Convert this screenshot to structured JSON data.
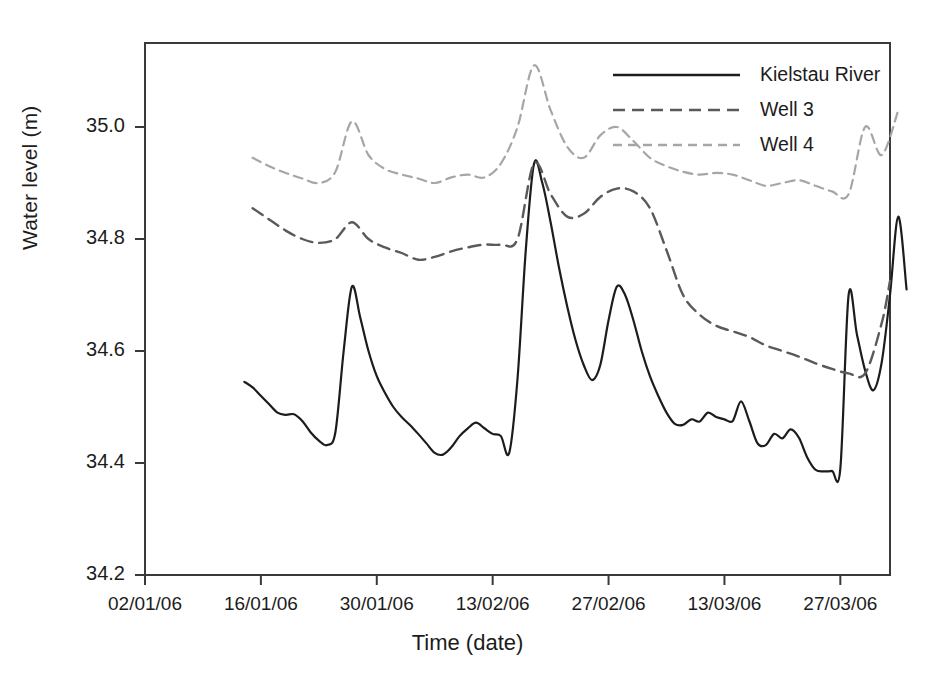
{
  "chart_data": {
    "type": "line",
    "title": "",
    "xlabel": "Time (date)",
    "ylabel": "Water level (m)",
    "ylim": [
      34.2,
      35.15
    ],
    "xlim": [
      "02/01/06",
      "31/03/06"
    ],
    "grid": false,
    "legend_position": "top-right",
    "yticks": [
      "34.2",
      "34.4",
      "34.6",
      "34.8",
      "35.0"
    ],
    "ytick_values": [
      34.2,
      34.4,
      34.6,
      34.8,
      35.0
    ],
    "xticks": [
      "02/01/06",
      "16/01/06",
      "30/01/06",
      "13/02/06",
      "27/02/06",
      "13/03/06",
      "27/03/06"
    ],
    "xtick_days": [
      0,
      14,
      28,
      42,
      56,
      70,
      84
    ],
    "series": [
      {
        "name": "Kielstau River",
        "color": "#1c1c1c",
        "dash": "none",
        "width": 2.2,
        "x": [
          12,
          13,
          14,
          15,
          16,
          17,
          18,
          19,
          20,
          21,
          22,
          23,
          24,
          25,
          26,
          27,
          28,
          29,
          30,
          31,
          32,
          33,
          34,
          35,
          36,
          37,
          38,
          39,
          40,
          41,
          42,
          43,
          44,
          45,
          46,
          47,
          48,
          49,
          50,
          51,
          52,
          53,
          54,
          55,
          56,
          57,
          58,
          59,
          60,
          61,
          62,
          63,
          64,
          65,
          66,
          67,
          68,
          69,
          70,
          71,
          72,
          73,
          74,
          75,
          76,
          77,
          78,
          79,
          80,
          81,
          82,
          83,
          84,
          85,
          86,
          87,
          88,
          89
        ],
        "values": [
          34.545,
          34.535,
          34.52,
          34.505,
          34.49,
          34.486,
          34.487,
          34.475,
          34.455,
          34.44,
          34.432,
          34.455,
          34.6,
          34.715,
          34.66,
          34.6,
          34.555,
          34.525,
          34.5,
          34.482,
          34.468,
          34.452,
          34.435,
          34.418,
          34.415,
          34.428,
          34.448,
          34.462,
          34.472,
          34.462,
          34.452,
          34.448,
          34.418,
          34.55,
          34.78,
          34.935,
          34.9,
          34.83,
          34.75,
          34.68,
          34.62,
          34.575,
          34.548,
          34.575,
          34.655,
          34.715,
          34.7,
          34.655,
          34.6,
          34.555,
          34.52,
          34.49,
          34.47,
          34.468,
          34.478,
          34.474,
          34.49,
          34.482,
          34.478,
          34.475,
          34.51,
          34.475,
          34.435,
          34.432,
          34.452,
          34.444,
          34.46,
          34.445,
          34.41,
          34.388,
          34.385,
          34.386,
          34.39,
          34.6,
          34.7,
          34.63,
          34.565,
          34.53
        ],
        "tail_x": [
          85,
          86,
          87,
          88,
          89,
          90,
          91,
          92
        ],
        "tail_values": [
          34.7,
          34.63,
          34.565,
          34.53,
          34.58,
          34.7,
          34.84,
          34.71
        ]
      },
      {
        "name": "Well 3",
        "color": "#5a5a5a",
        "dash": "12 7",
        "width": 2.4,
        "x": [
          13,
          15,
          17,
          19,
          21,
          23,
          25,
          27,
          29,
          31,
          33,
          35,
          37,
          39,
          41,
          43,
          45,
          47,
          49,
          51,
          53,
          55,
          57,
          59,
          61,
          63,
          65,
          67,
          69,
          71,
          73,
          75,
          77,
          79,
          81,
          83,
          85,
          87,
          89,
          90
        ],
        "values": [
          34.855,
          34.835,
          34.815,
          34.8,
          34.793,
          34.8,
          34.83,
          34.8,
          34.785,
          34.775,
          34.763,
          34.768,
          34.778,
          34.785,
          34.79,
          34.79,
          34.8,
          34.935,
          34.88,
          34.84,
          34.845,
          34.875,
          34.89,
          34.885,
          34.855,
          34.78,
          34.7,
          34.665,
          34.645,
          34.635,
          34.625,
          34.61,
          34.6,
          34.59,
          34.578,
          34.568,
          34.56,
          34.56,
          34.65,
          34.725
        ]
      },
      {
        "name": "Well 4",
        "color": "#a6a6a6",
        "dash": "9 6",
        "width": 2.2,
        "x": [
          13,
          15,
          17,
          19,
          21,
          23,
          25,
          27,
          29,
          31,
          33,
          35,
          37,
          39,
          41,
          43,
          45,
          47,
          49,
          51,
          53,
          55,
          57,
          59,
          61,
          63,
          65,
          67,
          69,
          71,
          73,
          75,
          77,
          79,
          81,
          83,
          85,
          87,
          89,
          91
        ],
        "values": [
          34.945,
          34.93,
          34.918,
          34.908,
          34.9,
          34.92,
          35.01,
          34.95,
          34.925,
          34.915,
          34.908,
          34.9,
          34.91,
          34.915,
          34.91,
          34.935,
          35.0,
          35.11,
          35.03,
          34.965,
          34.945,
          34.985,
          35.0,
          34.975,
          34.945,
          34.93,
          34.92,
          34.915,
          34.918,
          34.915,
          34.905,
          34.895,
          34.9,
          34.905,
          34.895,
          34.885,
          34.88,
          35.0,
          34.95,
          35.03
        ]
      }
    ]
  },
  "legend": {
    "entries": [
      {
        "label": "Kielstau River"
      },
      {
        "label": "Well 3"
      },
      {
        "label": "Well 4"
      }
    ]
  },
  "axes": {
    "y_title": "Water level (m)",
    "x_title": "Time (date)"
  }
}
